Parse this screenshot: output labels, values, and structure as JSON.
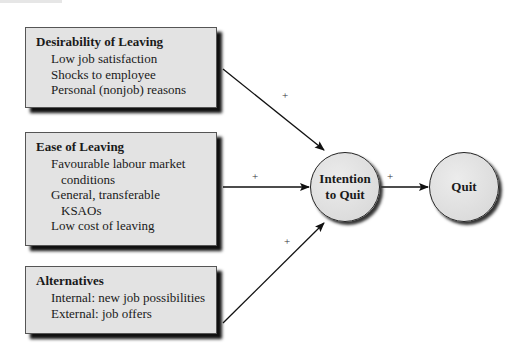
{
  "diagram": {
    "boxes": [
      {
        "title": "Desirability of Leaving",
        "items": [
          "Low job satisfaction",
          "Shocks to employee",
          "Personal (nonjob) reasons"
        ]
      },
      {
        "title": "Ease of Leaving",
        "items": [
          "Favourable labour market",
          "conditions",
          "General, transferable",
          "KSAOs",
          "Low cost of leaving"
        ]
      },
      {
        "title": "Alternatives",
        "items": [
          "Internal: new job possibilities",
          "External: job offers"
        ]
      }
    ],
    "nodes": {
      "intention": {
        "line1": "Intention",
        "line2": "to Quit"
      },
      "quit": {
        "label": "Quit"
      }
    },
    "edges": [
      {
        "from": "Desirability of Leaving",
        "to": "Intention to Quit",
        "sign": "+"
      },
      {
        "from": "Ease of Leaving",
        "to": "Intention to Quit",
        "sign": "+"
      },
      {
        "from": "Alternatives",
        "to": "Intention to Quit",
        "sign": "+"
      },
      {
        "from": "Intention to Quit",
        "to": "Quit",
        "sign": "+"
      }
    ]
  }
}
